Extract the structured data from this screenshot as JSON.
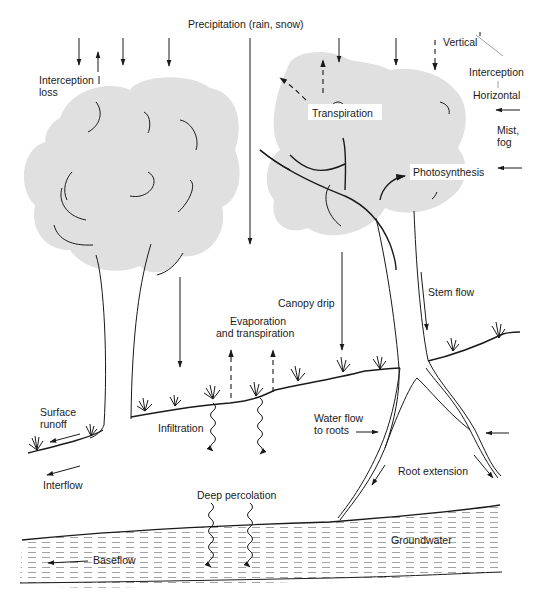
{
  "diagram": {
    "type": "hydrologic cycle of a forest",
    "colors": {
      "canopy": "#e0e0e0",
      "ink": "#1a1a1a",
      "background": "#ffffff"
    },
    "labels": {
      "precipitation": "Precipitation (rain, snow)",
      "interception_loss_1": "Interception",
      "interception_loss_2": "loss",
      "vertical": "Vertical",
      "interception": "Interception",
      "horizontal": "Horizontal",
      "mist_1": "Mist,",
      "mist_2": "fog",
      "transpiration": "Transpiration",
      "photosynthesis": "Photosynthesis",
      "canopy_drip": "Canopy drip",
      "stem_flow": "Stem flow",
      "evap_1": "Evaporation",
      "evap_2": "and transpiration",
      "surface_runoff_1": "Surface",
      "surface_runoff_2": "runoff",
      "infiltration": "Infiltration",
      "interflow": "Interflow",
      "water_flow_1": "Water flow",
      "water_flow_2": "to roots",
      "root_extension": "Root extension",
      "deep_percolation": "Deep percolation",
      "groundwater": "Groundwater",
      "baseflow": "Baseflow"
    },
    "nodes": [
      "Precipitation (rain, snow)",
      "Interception loss",
      "Vertical interception",
      "Horizontal interception",
      "Mist, fog",
      "Transpiration",
      "Photosynthesis",
      "Canopy drip",
      "Stem flow",
      "Evaporation and transpiration",
      "Surface runoff",
      "Infiltration",
      "Interflow",
      "Water flow to roots",
      "Root extension",
      "Deep percolation",
      "Groundwater",
      "Baseflow"
    ]
  }
}
